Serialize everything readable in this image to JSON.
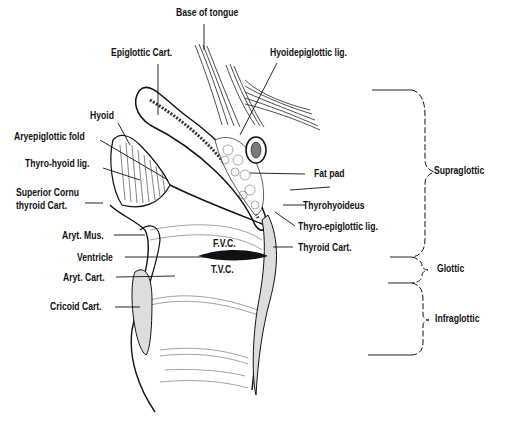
{
  "diagram": {
    "labels": {
      "base_of_tongue": "Base of tongue",
      "epiglottic_cart": "Epiglottic Cart.",
      "hyoidepiglottic_lig": "Hyoidepiglottic lig.",
      "hyoid": "Hyoid",
      "aryepiglottic_fold": "Aryepiglottic fold",
      "thyro_hyoid_lig": "Thyro-hyoid lig.",
      "superior_cornu_1": "Superior Cornu",
      "superior_cornu_2": "thyroid Cart.",
      "fat_pad": "Fat pad",
      "thyrohyoideus": "Thyrohyoideus",
      "thyro_epiglottic_lig": "Thyro-epiglottic lig.",
      "thyroid_cart": "Thyroid Cart.",
      "aryt_mus": "Aryt. Mus.",
      "ventricle": "Ventricle",
      "aryt_cart": "Aryt. Cart.",
      "cricoid_cart": "Cricoid Cart.",
      "fvc": "F.V.C.",
      "tvc": "T.V.C."
    },
    "regions": [
      {
        "name": "Supraglottic"
      },
      {
        "name": "Glottic"
      },
      {
        "name": "Infraglottic"
      }
    ]
  }
}
